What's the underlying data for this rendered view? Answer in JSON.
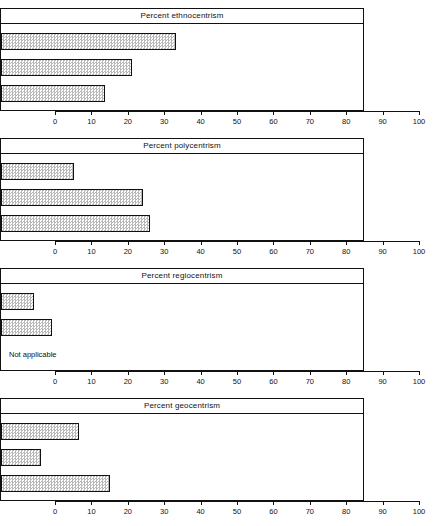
{
  "figure": {
    "axis": {
      "ticks": [
        0,
        10,
        20,
        30,
        40,
        50,
        60,
        70,
        80,
        90,
        100
      ],
      "min": 0,
      "max": 100
    },
    "categories": [
      "Alpha",
      "Beta",
      "Gamma"
    ],
    "not_applicable_label": "Not applicable"
  },
  "chart_data": [
    {
      "type": "bar",
      "orientation": "horizontal",
      "title": "Percent ethnocentrism",
      "categories": [
        "Alpha",
        "Beta",
        "Gamma"
      ],
      "values": [
        48,
        36,
        28.5
      ],
      "xlabel": "",
      "ylabel": "",
      "xlim": [
        0,
        100
      ],
      "xticks": [
        0,
        10,
        20,
        30,
        40,
        50,
        60,
        70,
        80,
        90,
        100
      ],
      "grid": false,
      "legend": false
    },
    {
      "type": "bar",
      "orientation": "horizontal",
      "title": "Percent polycentrism",
      "categories": [
        "Alpha",
        "Beta",
        "Gamma"
      ],
      "values": [
        20,
        39,
        41
      ],
      "xlabel": "",
      "ylabel": "",
      "xlim": [
        0,
        100
      ],
      "xticks": [
        0,
        10,
        20,
        30,
        40,
        50,
        60,
        70,
        80,
        90,
        100
      ],
      "grid": false,
      "legend": false
    },
    {
      "type": "bar",
      "orientation": "horizontal",
      "title": "Percent regiocentrism",
      "categories": [
        "Alpha",
        "Beta",
        "Gamma"
      ],
      "values": [
        9,
        14,
        null
      ],
      "annotations": [
        {
          "category": "Gamma",
          "text": "Not applicable"
        }
      ],
      "xlabel": "",
      "ylabel": "",
      "xlim": [
        0,
        100
      ],
      "xticks": [
        0,
        10,
        20,
        30,
        40,
        50,
        60,
        70,
        80,
        90,
        100
      ],
      "grid": false,
      "legend": false
    },
    {
      "type": "bar",
      "orientation": "horizontal",
      "title": "Percent geocentrism",
      "categories": [
        "Alpha",
        "Beta",
        "Gamma"
      ],
      "values": [
        21.5,
        11,
        30
      ],
      "xlabel": "",
      "ylabel": "",
      "xlim": [
        0,
        100
      ],
      "xticks": [
        0,
        10,
        20,
        30,
        40,
        50,
        60,
        70,
        80,
        90,
        100
      ],
      "grid": false,
      "legend": false
    }
  ]
}
